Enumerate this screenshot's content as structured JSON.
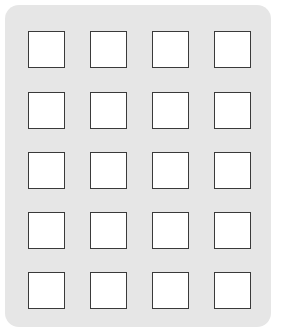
{
  "grid": {
    "rows": 5,
    "cols": 4,
    "panel_color": "#e6e6e6",
    "cell_color": "#ffffff",
    "border_color": "#3a3a3a",
    "col_x": [
      28,
      90,
      152,
      214
    ],
    "row_y": [
      31,
      92,
      152,
      212,
      272
    ]
  }
}
